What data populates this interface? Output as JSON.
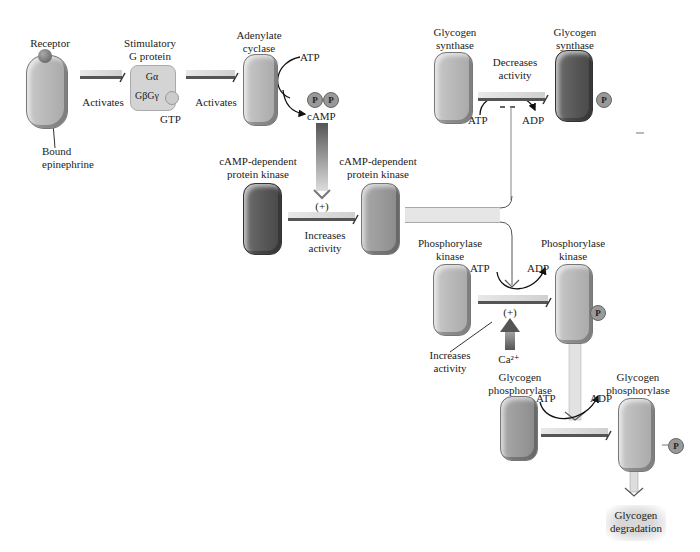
{
  "labels": {
    "receptor": "Receptor",
    "bound_epinephrine_1": "Bound",
    "bound_epinephrine_2": "epinephrine",
    "activates_1": "Activates",
    "stim_g_1": "Stimulatory",
    "stim_g_2": "G protein",
    "g_alpha": "Gα",
    "g_beta_gamma": "GβGγ",
    "gtp": "GTP",
    "activates_2": "Activates",
    "adenylate_1": "Adenylate",
    "adenylate_2": "cyclase",
    "atp_top": "ATP",
    "p1": "P",
    "p2": "P",
    "camp": "cAMP",
    "pka_inactive_1": "cAMP-dependent",
    "pka_inactive_2": "protein kinase",
    "plus_1": "(+)",
    "increases_1": "Increases",
    "activity_1": "activity",
    "pka_active_1": "cAMP-dependent",
    "pka_active_2": "protein kinase",
    "gs_1_a": "Glycogen",
    "gs_1_b": "synthase",
    "decreases_1": "Decreases",
    "decreases_2": "activity",
    "atp_gs": "ATP",
    "adp_gs": "ADP",
    "gs_2_a": "Glycogen",
    "gs_2_b": "synthase",
    "p_gs": "P",
    "phk_1_a": "Phosphorylase",
    "phk_1_b": "kinase",
    "atp_phk": "ATP",
    "adp_phk": "ADP",
    "phk_2_a": "Phosphorylase",
    "phk_2_b": "kinase",
    "plus_2": "(+)",
    "p_phk": "P",
    "increases_2": "Increases",
    "activity_2": "activity",
    "ca": "Ca²⁺",
    "gp_1_a": "Glycogen",
    "gp_1_b": "phosphorylase",
    "atp_gp": "ATP",
    "adp_gp": "ADP",
    "gp_2_a": "Glycogen",
    "gp_2_b": "phosphorylase",
    "p_gp": "P",
    "degradation_1": "Glycogen",
    "degradation_2": "degradation"
  }
}
